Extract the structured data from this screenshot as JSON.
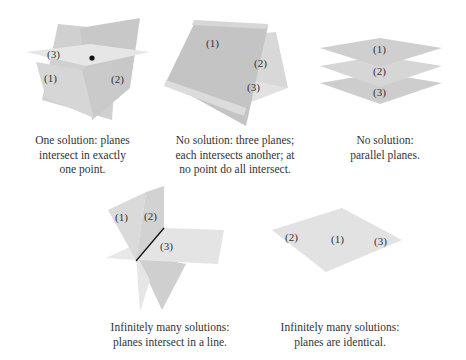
{
  "colors": {
    "plane_dark": "#c4c4c4",
    "plane_mid": "#d2d2d2",
    "plane_light": "#e0e0e0",
    "plane_lighter": "#e9e9e9",
    "text": "#333333",
    "line": "#111111"
  },
  "panels": [
    {
      "id": "one-solution",
      "labels": [
        "(1)",
        "(2)",
        "(3)"
      ],
      "caption": [
        "One solution: planes",
        "intersect in exactly",
        "one point."
      ]
    },
    {
      "id": "no-solution-pairwise",
      "labels": [
        "(1)",
        "(2)",
        "(3)"
      ],
      "caption": [
        "No solution: three planes;",
        "each intersects another; at",
        "no point do all intersect."
      ]
    },
    {
      "id": "no-solution-parallel",
      "labels": [
        "(1)",
        "(2)",
        "(3)"
      ],
      "caption": [
        "No solution:",
        "parallel planes."
      ]
    },
    {
      "id": "infinite-line",
      "labels": [
        "(1)",
        "(2)",
        "(3)"
      ],
      "caption": [
        "Infinitely many solutions:",
        "planes intersect in a line."
      ]
    },
    {
      "id": "infinite-identical",
      "labels": [
        "(2)",
        "(1)",
        "(3)"
      ],
      "caption": [
        "Infinitely many solutions:",
        "planes are identical."
      ]
    }
  ]
}
